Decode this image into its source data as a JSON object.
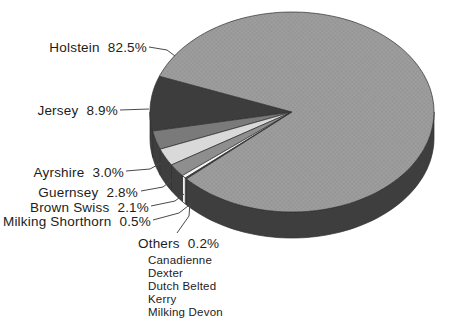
{
  "chart_data": {
    "type": "pie",
    "style": "3d-pie-grayscale-halftone",
    "title": "",
    "unit": "%",
    "slices": [
      {
        "label": "Holstein",
        "value": 82.5,
        "value_text": "82.5%",
        "color": "#9e9e9e",
        "texture": "halftone-dots"
      },
      {
        "label": "Jersey",
        "value": 8.9,
        "value_text": "8.9%",
        "color": "#3d3d3d"
      },
      {
        "label": "Ayrshire",
        "value": 3.0,
        "value_text": "3.0%",
        "color": "#7a7a7a"
      },
      {
        "label": "Guernsey",
        "value": 2.8,
        "value_text": "2.8%",
        "color": "#d9d9d9"
      },
      {
        "label": "Brown Swiss",
        "value": 2.1,
        "value_text": "2.1%",
        "color": "#8e8e8e"
      },
      {
        "label": "Milking Shorthorn",
        "value": 0.5,
        "value_text": "0.5%",
        "color": "#f4f4f4"
      },
      {
        "label": "Others",
        "value": 0.2,
        "value_text": "0.2%",
        "color": "#4a4a4a",
        "sub_items": [
          "Canadienne",
          "Dexter",
          "Dutch Belted",
          "Kerry",
          "Milking Devon"
        ]
      }
    ],
    "legend_position": "left-labels-with-leader-lines",
    "colors": {
      "side": "#3e3e3e",
      "side_light": "#efefef",
      "outline": "#2e2e2e",
      "leader_line": "#4a4a4a",
      "text": "#1c1c1c",
      "halftone_dot": "#878787",
      "background": "#ffffff"
    }
  }
}
